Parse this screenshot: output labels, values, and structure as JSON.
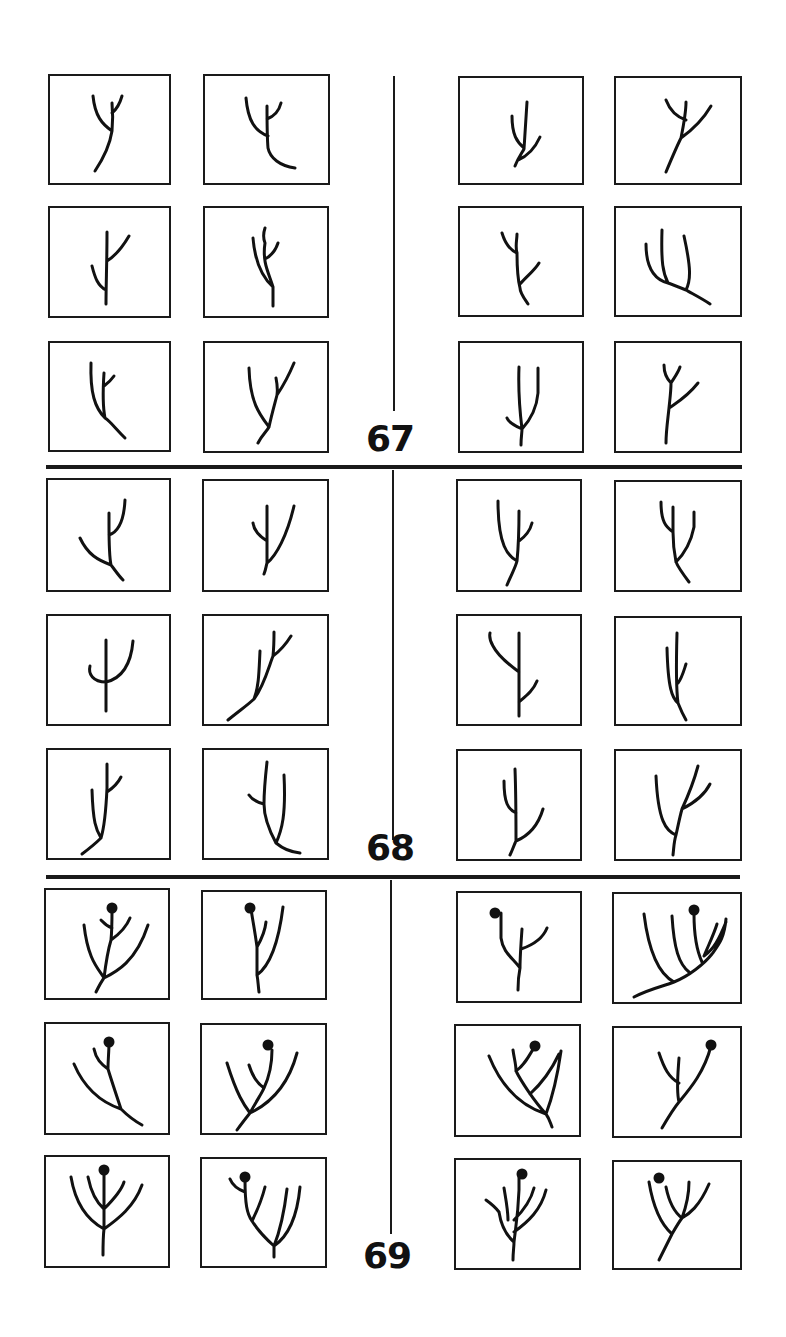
{
  "figure": {
    "groups": [
      {
        "label": "67",
        "label_pos": {
          "x": 366,
          "y": 421
        }
      },
      {
        "label": "68",
        "label_pos": {
          "x": 366,
          "y": 830
        }
      },
      {
        "label": "69",
        "label_pos": {
          "x": 363,
          "y": 1238
        }
      }
    ],
    "dividers": {
      "horizontal": [
        {
          "x": 46,
          "y": 465,
          "w": 696
        },
        {
          "x": 46,
          "y": 875,
          "w": 694
        }
      ],
      "vertical": [
        {
          "x": 393,
          "y": 76,
          "h": 335
        },
        {
          "x": 392,
          "y": 470,
          "h": 370
        },
        {
          "x": 390,
          "y": 880,
          "h": 354
        }
      ]
    },
    "panels": [
      {
        "group": "67",
        "x": 48,
        "y": 74,
        "w": 123,
        "h": 111,
        "paths": [
          "M45 95 C55 80,60 68,62 55 M62 55 C63 45,63 38,62 27 M62 55 C52 48,45 40,43 20 M62 37 C67 33,70 27,72 20"
        ],
        "nodes": []
      },
      {
        "group": "67",
        "x": 203,
        "y": 74,
        "w": 127,
        "h": 111,
        "paths": [
          "M90 92 C75 90,65 82,63 72 M63 72 C62 60,62 45,62 30 M63 60 C50 55,43 45,41 22 M62 43 C70 40,74 35,76 27"
        ],
        "nodes": []
      },
      {
        "group": "67",
        "x": 458,
        "y": 76,
        "w": 126,
        "h": 109,
        "paths": [
          "M55 88 C58 80,62 75,64 71 M64 71 C65 55,66 40,67 24 M64 70 C57 64,52 57,52 38 M58 82 C68 78,75 70,80 59"
        ],
        "nodes": []
      },
      {
        "group": "67",
        "x": 614,
        "y": 76,
        "w": 128,
        "h": 109,
        "paths": [
          "M50 94 C55 82,60 70,65 60 M65 60 C72 55,85 45,95 28 M65 60 C68 45,70 35,70 24 M70 42 C58 38,53 30,50 22"
        ],
        "nodes": []
      },
      {
        "group": "67",
        "x": 48,
        "y": 206,
        "w": 123,
        "h": 112,
        "paths": [
          "M56 96 C56 75,57 55,57 24 M56 82 C48 78,45 70,42 58 M57 53 C65 48,72 40,79 28"
        ],
        "nodes": []
      },
      {
        "group": "67",
        "x": 203,
        "y": 206,
        "w": 126,
        "h": 112,
        "paths": [
          "M68 98 C68 90,68 85,68 79 M68 79 C58 70,50 55,48 30 M68 79 C64 65,57 55,60 35 M60 35 C58 30,58 26,60 20 M60 51 C66 48,70 44,73 35"
        ],
        "nodes": []
      },
      {
        "group": "67",
        "x": 48,
        "y": 341,
        "w": 123,
        "h": 111,
        "paths": [
          "M75 95 C65 85,60 78,55 75 M55 75 C45 65,40 50,41 20 M55 75 C53 65,53 45,54 30 M54 43 C58 40,62 36,64 33"
        ],
        "nodes": []
      },
      {
        "group": "67",
        "x": 203,
        "y": 341,
        "w": 126,
        "h": 112,
        "paths": [
          "M53 100 C57 92,62 88,64 84 M64 84 C55 72,45 60,44 25 M64 84 C67 70,70 60,72 52 M72 52 C73 45,72 40,71 35 M72 52 C78 43,84 32,89 20"
        ],
        "nodes": []
      },
      {
        "group": "67",
        "x": 458,
        "y": 206,
        "w": 126,
        "h": 111,
        "paths": [
          "M68 96 C64 90,60 85,60 80 M60 80 C58 72,57 60,57 45 M57 45 C50 42,45 35,42 25 M57 45 C55 38,57 32,57 26 M60 76 C67 68,75 62,79 55"
        ],
        "nodes": []
      },
      {
        "group": "67",
        "x": 614,
        "y": 206,
        "w": 128,
        "h": 111,
        "paths": [
          "M94 96 C85 90,75 85,70 82 M70 82 C60 78,55 76,52 75 M52 75 C40 72,30 62,30 36 M52 75 C47 65,45 55,46 22 M70 82 C75 72,75 60,68 28"
        ],
        "nodes": []
      },
      {
        "group": "67",
        "x": 458,
        "y": 341,
        "w": 126,
        "h": 112,
        "paths": [
          "M61 102 C61 94,62 90,62 86 M62 86 C60 70,58 50,59 24 M62 86 C53 82,48 78,47 75 M62 86 C72 75,77 62,78 50 M78 50 C78 40,78 32,78 25"
        ],
        "nodes": []
      },
      {
        "group": "67",
        "x": 614,
        "y": 341,
        "w": 128,
        "h": 112,
        "paths": [
          "M50 100 C50 88,52 75,53 65 M53 65 C54 55,55 48,55 40 M55 40 C50 35,48 30,48 22 M55 40 C58 35,62 30,64 24 M53 65 C60 60,70 55,82 40"
        ],
        "nodes": []
      },
      {
        "group": "68",
        "x": 46,
        "y": 478,
        "w": 125,
        "h": 114,
        "paths": [
          "M75 100 C70 95,67 90,63 85 M63 85 C50 80,40 75,32 58 M63 85 C61 75,61 60,61 45 M61 45 C61 40,61 37,61 33 M61 55 C70 52,76 40,77 20"
        ],
        "nodes": []
      },
      {
        "group": "68",
        "x": 202,
        "y": 479,
        "w": 127,
        "h": 113,
        "paths": [
          "M60 93 C62 88,62 85,63 82 M63 82 C63 72,63 60,63 25 M63 60 C55 55,50 50,49 42 M63 82 C72 75,83 55,90 25"
        ],
        "nodes": []
      },
      {
        "group": "68",
        "x": 456,
        "y": 479,
        "w": 126,
        "h": 113,
        "paths": [
          "M49 104 C55 90,58 85,59 80 M59 80 C50 75,40 65,40 20 M59 80 C60 70,61 55,61 30 M61 60 C68 55,72 50,74 42"
        ],
        "nodes": []
      },
      {
        "group": "68",
        "x": 614,
        "y": 480,
        "w": 128,
        "h": 112,
        "paths": [
          "M73 100 C67 92,62 85,60 80 M60 80 C58 70,57 60,57 50 M57 50 C50 45,45 40,45 20 M57 50 C57 40,57 33,57 25 M60 80 C68 72,75 60,78 45 M78 45 C78 38,78 33,78 30"
        ],
        "nodes": []
      },
      {
        "group": "68",
        "x": 46,
        "y": 614,
        "w": 125,
        "h": 112,
        "paths": [
          "M58 95 C58 80,58 65,58 24 M58 66 C45 66,40 58,42 50 M58 66 C75 62,83 48,85 25"
        ],
        "nodes": []
      },
      {
        "group": "68",
        "x": 202,
        "y": 614,
        "w": 127,
        "h": 112,
        "paths": [
          "M24 104 C35 95,45 88,50 83 M50 83 C55 70,55 55,56 35 M50 83 C60 70,65 50,69 40 M69 40 C70 30,70 25,70 16 M69 40 C76 35,82 28,87 20"
        ],
        "nodes": []
      },
      {
        "group": "68",
        "x": 456,
        "y": 614,
        "w": 126,
        "h": 112,
        "paths": [
          "M61 100 C61 85,61 70,61 56 M61 56 C50 48,40 40,35 30 M35 30 C32 25,31 22,32 17 M61 56 C61 45,61 35,61 17 M61 86 C68 80,75 75,79 65"
        ],
        "nodes": []
      },
      {
        "group": "68",
        "x": 614,
        "y": 616,
        "w": 128,
        "h": 110,
        "paths": [
          "M70 102 C66 95,64 90,62 85 M62 85 C56 80,52 70,51 30 M62 85 C60 70,60 50,61 15 M62 65 C66 60,68 52,70 46"
        ],
        "nodes": []
      },
      {
        "group": "68",
        "x": 46,
        "y": 748,
        "w": 125,
        "h": 112,
        "paths": [
          "M34 104 C42 98,48 93,53 88 M53 88 C48 80,45 72,44 40 M53 88 C57 75,58 60,59 38 M59 38 C59 30,59 25,59 14 M59 42 C65 38,70 33,73 27"
        ],
        "nodes": []
      },
      {
        "group": "68",
        "x": 202,
        "y": 748,
        "w": 127,
        "h": 112,
        "paths": [
          "M96 103 C85 102,78 98,72 93 M72 93 C65 80,60 65,60 54 M60 54 C60 40,61 30,63 12 M60 54 C52 52,47 48,45 45 M72 93 C78 80,82 65,80 25"
        ],
        "nodes": []
      },
      {
        "group": "68",
        "x": 456,
        "y": 749,
        "w": 126,
        "h": 112,
        "paths": [
          "M52 104 C55 98,56 94,58 90 M58 90 C70 85,80 75,85 58 M58 90 C58 70,58 45,57 18 M58 62 C50 58,46 52,46 30"
        ],
        "nodes": []
      },
      {
        "group": "68",
        "x": 614,
        "y": 749,
        "w": 128,
        "h": 112,
        "paths": [
          "M57 104 C58 95,58 90,60 84 M60 84 C50 80,42 70,40 25 M60 84 C62 75,64 65,66 58 M66 58 C72 45,78 30,82 15 M66 58 C78 52,88 45,94 33"
        ],
        "nodes": []
      },
      {
        "group": "69",
        "x": 44,
        "y": 888,
        "w": 126,
        "h": 112,
        "paths": [
          "M50 102 C53 96,55 92,58 88 M58 88 C70 82,90 72,102 35 M58 88 C52 78,42 70,38 35 M58 88 C60 72,62 60,65 50 M65 50 C72 45,80 38,84 28 M65 50 C66 40,66 32,66 20 M66 38 C60 36,57 32,55 30"
        ],
        "nodes": [
          {
            "cx": 66,
            "cy": 18,
            "r": 5.5
          }
        ]
      },
      {
        "group": "69",
        "x": 201,
        "y": 890,
        "w": 126,
        "h": 110,
        "paths": [
          "M56 100 C55 92,55 88,54 83 M54 83 C65 75,75 55,80 15 M54 83 C54 70,54 60,54 55 M54 55 C58 48,62 40,63 30 M54 55 C52 40,50 30,48 17"
        ],
        "nodes": [
          {
            "cx": 47,
            "cy": 16,
            "r": 5.5
          }
        ]
      },
      {
        "group": "69",
        "x": 456,
        "y": 891,
        "w": 126,
        "h": 112,
        "paths": [
          "M60 97 C60 88,61 80,62 75 M62 75 C55 65,45 60,43 45 M43 45 C43 35,43 28,43 20 M62 75 C62 65,63 50,64 36 M63 56 C75 52,85 45,89 35"
        ],
        "nodes": [
          {
            "cx": 37,
            "cy": 20,
            "r": 5.5
          }
        ]
      },
      {
        "group": "69",
        "x": 612,
        "y": 892,
        "w": 130,
        "h": 112,
        "paths": [
          "M20 103 C35 95,50 92,60 88 M60 88 C75 82,90 70,98 60 M98 60 C105 50,110 45,112 25 M60 88 C45 80,35 60,30 20 M75 78 C65 70,60 55,58 22 M88 68 C82 55,80 40,80 20 M90 62 C100 55,105 45,112 28 M90 62 C95 50,100 40,103 30"
        ],
        "nodes": [
          {
            "cx": 80,
            "cy": 16,
            "r": 5.5
          }
        ]
      },
      {
        "group": "69",
        "x": 44,
        "y": 1022,
        "w": 126,
        "h": 113,
        "paths": [
          "M96 101 C85 95,80 90,75 85 M75 85 C60 80,40 68,28 40 M75 85 C70 70,65 55,62 45 M62 45 C55 40,50 35,48 25 M62 45 C62 35,63 28,63 18"
        ],
        "nodes": [
          {
            "cx": 63,
            "cy": 18,
            "r": 5.5
          }
        ]
      },
      {
        "group": "69",
        "x": 200,
        "y": 1023,
        "w": 127,
        "h": 112,
        "paths": [
          "M35 105 C40 98,44 93,48 88 M48 88 C65 80,85 65,95 28 M48 88 C42 80,35 70,25 38 M48 88 C55 75,60 68,62 63 M62 63 C55 58,50 50,47 40 M62 63 C68 50,70 40,70 25"
        ],
        "nodes": [
          {
            "cx": 66,
            "cy": 20,
            "r": 5.5
          }
        ]
      },
      {
        "group": "69",
        "x": 454,
        "y": 1024,
        "w": 127,
        "h": 113,
        "paths": [
          "M96 101 C94 96,93 92,90 88 M90 88 C65 80,45 60,33 30 M90 88 C78 75,65 55,60 45 M60 45 C60 38,58 32,57 24 M60 45 C68 40,73 30,79 20 M90 88 C95 75,100 60,105 25 M74 68 C85 58,95 45,103 28"
        ],
        "nodes": [
          {
            "cx": 79,
            "cy": 20,
            "r": 5.5
          }
        ]
      },
      {
        "group": "69",
        "x": 612,
        "y": 1026,
        "w": 130,
        "h": 112,
        "paths": [
          "M48 100 C55 88,60 80,65 74 M65 74 C75 62,90 45,97 18 M65 74 C62 62,64 45,65 30 M65 55 C55 50,50 40,45 25"
        ],
        "nodes": [
          {
            "cx": 97,
            "cy": 17,
            "r": 5.5
          }
        ]
      },
      {
        "group": "69",
        "x": 44,
        "y": 1155,
        "w": 126,
        "h": 113,
        "paths": [
          "M57 98 C57 88,57 80,58 72 M58 72 C45 65,30 50,25 20 M58 72 C58 60,58 45,58 30 M58 30 C58 22,58 18,58 14 M58 52 C50 45,45 35,42 20 M58 52 C65 45,75 35,78 25 M58 72 C72 62,88 50,96 28"
        ],
        "nodes": [
          {
            "cx": 58,
            "cy": 13,
            "r": 5.5
          }
        ]
      },
      {
        "group": "69",
        "x": 200,
        "y": 1157,
        "w": 127,
        "h": 111,
        "paths": [
          "M72 98 C72 92,72 90,72 87 M72 87 C62 78,55 70,50 62 M50 62 C45 55,43 45,43 20 M43 33 C35 30,30 25,28 20 M50 62 C55 52,60 40,63 28 M72 87 C78 72,82 55,85 30 M72 87 C85 78,95 60,98 28"
        ],
        "nodes": [
          {
            "cx": 43,
            "cy": 18,
            "r": 5.5
          }
        ]
      },
      {
        "group": "69",
        "x": 454,
        "y": 1158,
        "w": 127,
        "h": 112,
        "paths": [
          "M57 100 C57 92,58 87,58 82 M58 82 C50 75,45 65,43 52 M43 52 C40 48,37 45,30 40 M58 82 C60 65,62 55,63 30 M63 30 C63 24,63 20,63 15 M58 72 C72 62,85 50,90 30 M58 60 C68 50,75 40,78 28 M52 60 C52 50,50 40,48 28"
        ],
        "nodes": [
          {
            "cx": 66,
            "cy": 14,
            "r": 5.5
          }
        ]
      },
      {
        "group": "69",
        "x": 612,
        "y": 1160,
        "w": 130,
        "h": 110,
        "paths": [
          "M45 98 C50 88,55 78,58 72 M58 72 C50 65,40 50,35 20 M58 72 C62 65,65 60,68 56 M68 56 C75 52,85 45,95 22 M68 56 C60 50,55 40,52 25 M68 56 C72 45,75 35,75 20"
        ],
        "nodes": [
          {
            "cx": 45,
            "cy": 16,
            "r": 5.5
          }
        ]
      }
    ]
  }
}
